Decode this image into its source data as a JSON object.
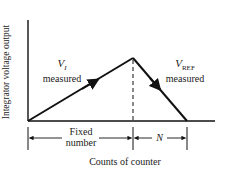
{
  "diagram": {
    "type": "dual-slope integrator waveform",
    "y_axis_label": "Integrator voltage output",
    "x_axis_label": "Counts of counter",
    "ramp_up": {
      "symbol": "V",
      "subscript": "I",
      "label": "measured"
    },
    "ramp_down": {
      "symbol": "V",
      "subscript": "REF",
      "label": "measured"
    },
    "interval_1": {
      "line1": "Fixed",
      "line2": "number"
    },
    "interval_2": {
      "label": "N"
    },
    "colors": {
      "line": "#111111",
      "background": "#ffffff"
    }
  }
}
